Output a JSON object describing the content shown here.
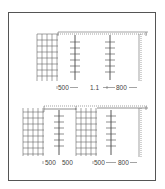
{
  "figure_top": {
    "labels": [
      {
        "text": "500",
        "x": 58,
        "y": 83
      },
      {
        "text": "1.1",
        "x": 89,
        "y": 83
      },
      {
        "text": "800",
        "x": 117,
        "y": 83
      }
    ]
  },
  "figure_bottom": {
    "labels": [
      {
        "text": "500",
        "x": 44,
        "y": 158
      },
      {
        "text": "500",
        "x": 62,
        "y": 158
      },
      {
        "text": "500",
        "x": 94,
        "y": 158
      },
      {
        "text": "800",
        "x": 118,
        "y": 158
      }
    ]
  },
  "colors": {
    "line": "#555555",
    "frame": "#555555"
  }
}
